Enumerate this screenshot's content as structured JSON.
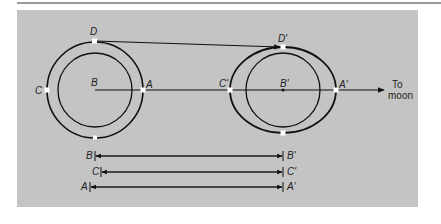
{
  "figure": {
    "colors": {
      "background": "#ffffff",
      "panel": "#c4c4c4",
      "rule": "#9a9a9a",
      "ink": "#111111",
      "marker": "#ffffff"
    },
    "earth": {
      "labels": {
        "D": "D",
        "C": "C",
        "B": "B",
        "A": "A"
      }
    },
    "deformed_earth": {
      "labels": {
        "D": "D′",
        "C": "C′",
        "B": "B′",
        "A": "A′"
      }
    },
    "direction": {
      "line1": "To",
      "line2": "moon"
    },
    "distance_bars": [
      {
        "start_label": "B",
        "end_label": "B′"
      },
      {
        "start_label": "C",
        "end_label": "C′"
      },
      {
        "start_label": "A",
        "end_label": "A′"
      }
    ]
  }
}
